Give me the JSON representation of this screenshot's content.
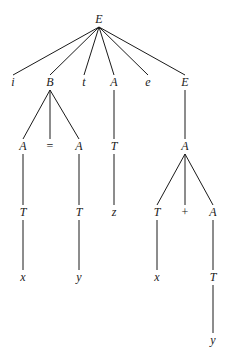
{
  "diagram": {
    "type": "parse-tree",
    "nodes": [
      {
        "id": "n0",
        "label": "E",
        "x": 99,
        "y": 23,
        "op": false
      },
      {
        "id": "n1",
        "label": "i",
        "x": 13,
        "y": 86,
        "op": false
      },
      {
        "id": "n2",
        "label": "B",
        "x": 50,
        "y": 86,
        "op": false
      },
      {
        "id": "n3",
        "label": "t",
        "x": 84,
        "y": 86,
        "op": false
      },
      {
        "id": "n4",
        "label": "A",
        "x": 114,
        "y": 86,
        "op": false
      },
      {
        "id": "n5",
        "label": "e",
        "x": 148,
        "y": 86,
        "op": false
      },
      {
        "id": "n6",
        "label": "E",
        "x": 185,
        "y": 86,
        "op": false
      },
      {
        "id": "n7",
        "label": "A",
        "x": 23,
        "y": 150,
        "op": false
      },
      {
        "id": "n8",
        "label": "=",
        "x": 50,
        "y": 150,
        "op": true
      },
      {
        "id": "n9",
        "label": "A",
        "x": 79,
        "y": 150,
        "op": false
      },
      {
        "id": "n10",
        "label": "T",
        "x": 114,
        "y": 150,
        "op": false
      },
      {
        "id": "n11",
        "label": "A",
        "x": 185,
        "y": 150,
        "op": false
      },
      {
        "id": "n12",
        "label": "T",
        "x": 23,
        "y": 216,
        "op": false
      },
      {
        "id": "n13",
        "label": "T",
        "x": 79,
        "y": 216,
        "op": false
      },
      {
        "id": "n14",
        "label": "z",
        "x": 114,
        "y": 216,
        "op": false
      },
      {
        "id": "n15",
        "label": "T",
        "x": 157,
        "y": 216,
        "op": false
      },
      {
        "id": "n16",
        "label": "+",
        "x": 185,
        "y": 216,
        "op": true
      },
      {
        "id": "n17",
        "label": "A",
        "x": 213,
        "y": 216,
        "op": false
      },
      {
        "id": "n18",
        "label": "x",
        "x": 23,
        "y": 281,
        "op": false
      },
      {
        "id": "n19",
        "label": "y",
        "x": 79,
        "y": 281,
        "op": false
      },
      {
        "id": "n20",
        "label": "x",
        "x": 157,
        "y": 281,
        "op": false
      },
      {
        "id": "n21",
        "label": "T",
        "x": 213,
        "y": 281,
        "op": false
      },
      {
        "id": "n22",
        "label": "y",
        "x": 213,
        "y": 344,
        "op": false
      }
    ],
    "edges": [
      [
        "n0",
        "n1"
      ],
      [
        "n0",
        "n2"
      ],
      [
        "n0",
        "n3"
      ],
      [
        "n0",
        "n4"
      ],
      [
        "n0",
        "n5"
      ],
      [
        "n0",
        "n6"
      ],
      [
        "n2",
        "n7"
      ],
      [
        "n2",
        "n8"
      ],
      [
        "n2",
        "n9"
      ],
      [
        "n4",
        "n10"
      ],
      [
        "n6",
        "n11"
      ],
      [
        "n7",
        "n12"
      ],
      [
        "n9",
        "n13"
      ],
      [
        "n10",
        "n14"
      ],
      [
        "n11",
        "n15"
      ],
      [
        "n11",
        "n16"
      ],
      [
        "n11",
        "n17"
      ],
      [
        "n12",
        "n18"
      ],
      [
        "n13",
        "n19"
      ],
      [
        "n15",
        "n20"
      ],
      [
        "n17",
        "n21"
      ],
      [
        "n21",
        "n22"
      ]
    ]
  }
}
